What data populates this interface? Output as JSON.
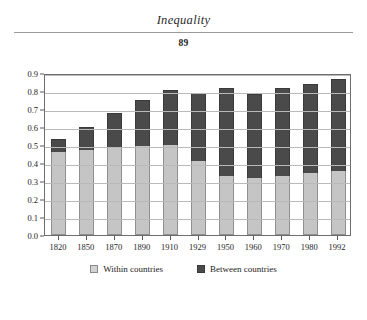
{
  "page": {
    "running_head": "Inequality",
    "folio": "89"
  },
  "legend": {
    "within_label": "Within countries",
    "between_label": "Between countries"
  },
  "colors": {
    "within": "#c5c5c5",
    "between": "#4a4a4a",
    "gridline": "#b9b9b9",
    "frame": "#6e6e6e"
  },
  "chart_data": {
    "type": "bar",
    "stacked": true,
    "title": "",
    "xlabel": "",
    "ylabel": "",
    "ylim": [
      0.0,
      0.9
    ],
    "yticks": [
      "0.0",
      "0.1",
      "0.2",
      "0.3",
      "0.4",
      "0.5",
      "0.6",
      "0.7",
      "0.8",
      "0.9"
    ],
    "grid": true,
    "legend_position": "bottom",
    "categories": [
      "1820",
      "1850",
      "1870",
      "1890",
      "1910",
      "1929",
      "1950",
      "1960",
      "1970",
      "1980",
      "1992"
    ],
    "series": [
      {
        "name": "Within countries",
        "values": [
          0.46,
          0.47,
          0.48,
          0.49,
          0.495,
          0.41,
          0.325,
          0.315,
          0.325,
          0.34,
          0.355
        ]
      },
      {
        "name": "Between countries",
        "values": [
          0.07,
          0.13,
          0.195,
          0.255,
          0.31,
          0.375,
          0.49,
          0.465,
          0.49,
          0.495,
          0.51
        ]
      }
    ],
    "totals": [
      0.53,
      0.6,
      0.675,
      0.745,
      0.805,
      0.785,
      0.815,
      0.78,
      0.815,
      0.835,
      0.865
    ]
  }
}
